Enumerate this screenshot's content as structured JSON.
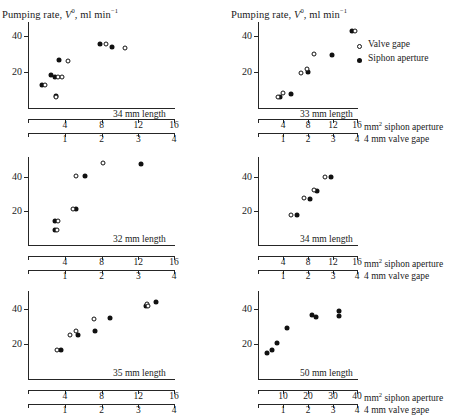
{
  "figure": {
    "y_axis_title_prefix": "Pumping rate, ",
    "y_axis_title_var": "V",
    "y_axis_title_sup": "0",
    "y_axis_title_suffix": ", ml min",
    "y_axis_title_suffix_sup": "−1",
    "x_axis_label_top": "mm",
    "x_axis_label_top_sup": "2",
    "x_axis_label_top_rest": " siphon aperture",
    "x_axis_label_bottom": "4 mm valve gape",
    "siphon_axis_name": "mm² siphon aperture",
    "valve_axis_name": "mm valve gape"
  },
  "legend": {
    "items": [
      {
        "marker": "open-circle",
        "label": "Valve gape"
      },
      {
        "marker": "filled-circle",
        "label": "Siphon aperture"
      }
    ]
  },
  "chart_data": [
    {
      "id": "panel-34mm-a",
      "type": "scatter",
      "title": "34 mm length",
      "xlabel": "mm² siphon aperture",
      "xlabel_secondary": "mm valve gape",
      "ylabel": "Pumping rate, V⁰, ml min⁻¹",
      "xlim": [
        0,
        16
      ],
      "ylim": [
        0,
        48
      ],
      "xticks": [
        4,
        8,
        12,
        16
      ],
      "xticks_secondary": [
        1,
        2,
        3,
        4
      ],
      "yticks": [
        20,
        40
      ],
      "grid": false,
      "series": [
        {
          "name": "Siphon aperture",
          "marker": "filled-circle",
          "points": [
            {
              "x": 1.5,
              "y": 13.0
            },
            {
              "x": 2.5,
              "y": 18.5
            },
            {
              "x": 2.9,
              "y": 17.5
            },
            {
              "x": 3.0,
              "y": 6.5
            },
            {
              "x": 3.4,
              "y": 27.0
            },
            {
              "x": 7.8,
              "y": 36.0
            },
            {
              "x": 9.1,
              "y": 34.0
            }
          ]
        },
        {
          "name": "Valve gape",
          "marker": "open-circle",
          "points": [
            {
              "x": 1.9,
              "y": 13.0
            },
            {
              "x": 3.1,
              "y": 6.0
            },
            {
              "x": 3.3,
              "y": 17.5
            },
            {
              "x": 3.7,
              "y": 17.5
            },
            {
              "x": 4.4,
              "y": 26.5
            },
            {
              "x": 8.5,
              "y": 36.0
            },
            {
              "x": 10.6,
              "y": 33.5
            }
          ]
        }
      ]
    },
    {
      "id": "panel-33mm",
      "type": "scatter",
      "title": "33 mm length",
      "xlabel": "mm² siphon aperture",
      "xlabel_secondary": "mm valve gape",
      "ylabel": "Pumping rate, V⁰, ml min⁻¹",
      "xlim": [
        0,
        16
      ],
      "ylim": [
        0,
        48
      ],
      "xticks": [
        4,
        8,
        12,
        16
      ],
      "xticks_secondary": [
        1,
        2,
        3,
        4
      ],
      "yticks": [
        20,
        40
      ],
      "grid": false,
      "series": [
        {
          "name": "Siphon aperture",
          "marker": "filled-circle",
          "points": [
            {
              "x": 3.5,
              "y": 6.0
            },
            {
              "x": 5.2,
              "y": 8.0
            },
            {
              "x": 8.0,
              "y": 20.0
            },
            {
              "x": 11.9,
              "y": 29.5
            },
            {
              "x": 15.0,
              "y": 43.0
            }
          ]
        },
        {
          "name": "Valve gape",
          "marker": "open-circle",
          "points": [
            {
              "x": 3.2,
              "y": 6.3
            },
            {
              "x": 4.0,
              "y": 8.5
            },
            {
              "x": 6.8,
              "y": 19.5
            },
            {
              "x": 7.9,
              "y": 22.0
            },
            {
              "x": 9.0,
              "y": 30.0
            },
            {
              "x": 15.5,
              "y": 43.0
            }
          ]
        }
      ]
    },
    {
      "id": "panel-32mm",
      "type": "scatter",
      "title": "32 mm length",
      "xlabel": "mm² siphon aperture",
      "xlabel_secondary": "mm valve gape",
      "ylabel": "Pumping rate, V⁰, ml min⁻¹",
      "xlim": [
        0,
        16
      ],
      "ylim": [
        0,
        52
      ],
      "xticks": [
        4,
        8,
        12,
        16
      ],
      "xticks_secondary": [
        1,
        2,
        3,
        4
      ],
      "yticks": [
        20,
        40
      ],
      "grid": false,
      "series": [
        {
          "name": "Siphon aperture",
          "marker": "filled-circle",
          "points": [
            {
              "x": 2.9,
              "y": 14.0
            },
            {
              "x": 2.9,
              "y": 9.0
            },
            {
              "x": 5.2,
              "y": 21.0
            },
            {
              "x": 6.2,
              "y": 41.0
            },
            {
              "x": 12.3,
              "y": 48.0
            }
          ]
        },
        {
          "name": "Valve gape",
          "marker": "open-circle",
          "points": [
            {
              "x": 3.3,
              "y": 14.0
            },
            {
              "x": 3.2,
              "y": 9.0
            },
            {
              "x": 4.9,
              "y": 21.0
            },
            {
              "x": 5.2,
              "y": 41.0
            },
            {
              "x": 8.2,
              "y": 48.5
            }
          ]
        }
      ]
    },
    {
      "id": "panel-34mm-b",
      "type": "scatter",
      "title": "34 mm length",
      "xlabel": "mm² siphon aperture",
      "xlabel_secondary": "mm valve gape",
      "ylabel": "Pumping rate, V⁰, ml min⁻¹",
      "xlim": [
        0,
        16
      ],
      "ylim": [
        0,
        52
      ],
      "xticks": [
        4,
        8,
        12,
        16
      ],
      "xticks_secondary": [
        1,
        2,
        3,
        4
      ],
      "yticks": [
        20,
        40
      ],
      "grid": false,
      "series": [
        {
          "name": "Siphon aperture",
          "marker": "filled-circle",
          "points": [
            {
              "x": 6.3,
              "y": 18.0
            },
            {
              "x": 8.3,
              "y": 27.0
            },
            {
              "x": 9.5,
              "y": 32.0
            },
            {
              "x": 11.6,
              "y": 40.0
            }
          ]
        },
        {
          "name": "Valve gape",
          "marker": "open-circle",
          "points": [
            {
              "x": 5.2,
              "y": 18.0
            },
            {
              "x": 7.4,
              "y": 27.5
            },
            {
              "x": 8.9,
              "y": 32.5
            },
            {
              "x": 10.7,
              "y": 40.0
            }
          ]
        }
      ]
    },
    {
      "id": "panel-35mm",
      "type": "scatter",
      "title": "35 mm length",
      "xlabel": "mm² siphon aperture",
      "xlabel_secondary": "mm valve gape",
      "ylabel": "Pumping rate, V⁰, ml min⁻¹",
      "xlim": [
        0,
        16
      ],
      "ylim": [
        0,
        50
      ],
      "xticks": [
        4,
        8,
        12,
        16
      ],
      "xticks_secondary": [
        1,
        2,
        3,
        4
      ],
      "yticks": [
        20,
        40
      ],
      "grid": false,
      "series": [
        {
          "name": "Siphon aperture",
          "marker": "filled-circle",
          "points": [
            {
              "x": 3.6,
              "y": 16.5
            },
            {
              "x": 5.4,
              "y": 25.0
            },
            {
              "x": 7.3,
              "y": 27.5
            },
            {
              "x": 8.9,
              "y": 34.5
            },
            {
              "x": 12.8,
              "y": 41.5
            },
            {
              "x": 13.9,
              "y": 43.5
            }
          ]
        },
        {
          "name": "Valve gape",
          "marker": "open-circle",
          "points": [
            {
              "x": 3.2,
              "y": 16.5
            },
            {
              "x": 4.6,
              "y": 25.0
            },
            {
              "x": 5.2,
              "y": 27.5
            },
            {
              "x": 7.2,
              "y": 34.0
            },
            {
              "x": 12.9,
              "y": 42.5
            },
            {
              "x": 13.1,
              "y": 41.5
            }
          ]
        }
      ]
    },
    {
      "id": "panel-50mm",
      "type": "scatter",
      "title": "50 mm length",
      "xlabel": "mm² siphon aperture",
      "xlabel_secondary": "mm valve gape",
      "ylabel": "Pumping rate, V⁰, ml min⁻¹",
      "xlim": [
        0,
        40
      ],
      "ylim": [
        0,
        50
      ],
      "xticks": [
        10,
        20,
        30,
        40
      ],
      "xticks_secondary": [
        1,
        2,
        3,
        4
      ],
      "yticks": [
        20,
        40
      ],
      "grid": false,
      "series": [
        {
          "name": "Siphon aperture",
          "marker": "filled-circle",
          "points": [
            {
              "x": 3.5,
              "y": 15.0
            },
            {
              "x": 5.5,
              "y": 16.5
            },
            {
              "x": 7.5,
              "y": 20.5
            },
            {
              "x": 11.5,
              "y": 29.0
            },
            {
              "x": 21.5,
              "y": 36.5
            },
            {
              "x": 23.0,
              "y": 35.5
            },
            {
              "x": 32.5,
              "y": 38.5
            },
            {
              "x": 32.5,
              "y": 36.0
            }
          ]
        },
        {
          "name": "Valve gape",
          "marker": "open-circle",
          "points": []
        }
      ]
    }
  ],
  "panels": [
    {
      "label": "34 mm length"
    },
    {
      "label": "33 mm length"
    },
    {
      "label": "32 mm length"
    },
    {
      "label": "34 mm length"
    },
    {
      "label": "35 mm length"
    },
    {
      "label": "50 mm length"
    }
  ]
}
